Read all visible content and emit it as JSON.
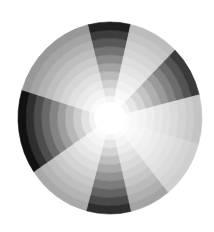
{
  "wheel": {
    "center": [
      110,
      118
    ],
    "radius_x": 92,
    "radius_y": 96,
    "inner_white_radius": 14,
    "rings": 10,
    "center_color": "#ffffff",
    "sectors": [
      {
        "name": "top-dark",
        "start": -14,
        "end": 13,
        "outer": "#202020"
      },
      {
        "name": "upper-right-light",
        "start": 13,
        "end": 45,
        "outer": "#bdbdbd"
      },
      {
        "name": "right-dark",
        "start": 45,
        "end": 76,
        "outer": "#3a3a3a"
      },
      {
        "name": "right-lightest",
        "start": 76,
        "end": 106,
        "outer": "#c4c4c4"
      },
      {
        "name": "lower-right-white",
        "start": 106,
        "end": 141,
        "outer": "#cfcfcf"
      },
      {
        "name": "lower-right-mid",
        "start": 141,
        "end": 167,
        "outer": "#a4a4a4"
      },
      {
        "name": "bottom-dark",
        "start": 167,
        "end": 195,
        "outer": "#2e2e2e"
      },
      {
        "name": "lower-left-light",
        "start": 195,
        "end": 236,
        "outer": "#a9a9a9"
      },
      {
        "name": "left-black",
        "start": 236,
        "end": 287,
        "outer": "#111111"
      },
      {
        "name": "upper-left-mid",
        "start": 287,
        "end": 346,
        "outer": "#989898"
      }
    ]
  }
}
